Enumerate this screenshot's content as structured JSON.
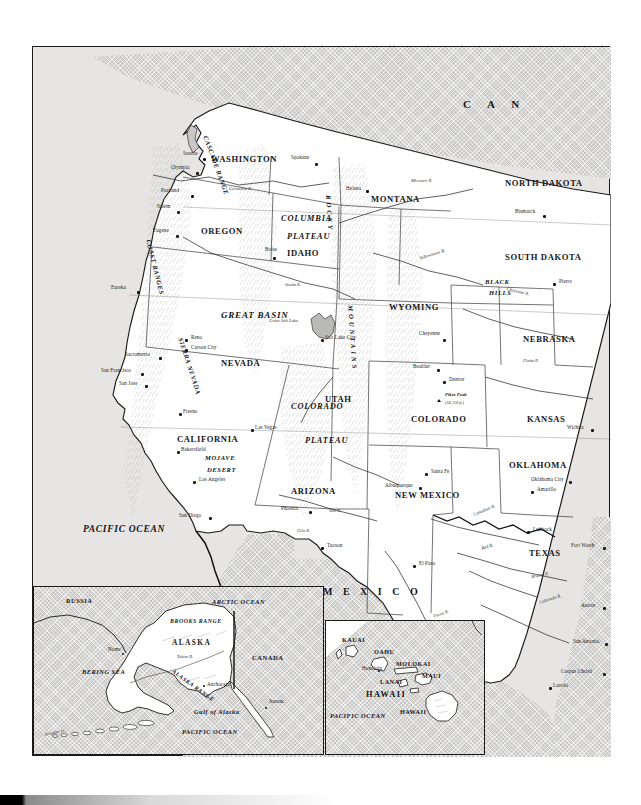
{
  "map": {
    "title": "Physical and political map of the Western United States",
    "countries": [
      {
        "name": "C  A  N",
        "full": "CANADA"
      },
      {
        "name": "M E X I C O",
        "full": "MEXICO"
      }
    ],
    "oceans": [
      {
        "label": "PACIFIC OCEAN"
      }
    ],
    "states": [
      {
        "label": "WASHINGTON"
      },
      {
        "label": "OREGON"
      },
      {
        "label": "IDAHO"
      },
      {
        "label": "MONTANA"
      },
      {
        "label": "NORTH DAKOTA"
      },
      {
        "label": "SOUTH DAKOTA"
      },
      {
        "label": "WYOMING"
      },
      {
        "label": "NEBRASKA"
      },
      {
        "label": "NEVADA"
      },
      {
        "label": "UTAH"
      },
      {
        "label": "COLORADO"
      },
      {
        "label": "KANSAS"
      },
      {
        "label": "CALIFORNIA"
      },
      {
        "label": "ARIZONA"
      },
      {
        "label": "NEW MEXICO"
      },
      {
        "label": "OKLAHOMA"
      },
      {
        "label": "TEXAS"
      }
    ],
    "physiographic": [
      {
        "label": "COLUMBIA"
      },
      {
        "label": "PLATEAU"
      },
      {
        "label": "GREAT BASIN"
      },
      {
        "label": "COLORADO"
      },
      {
        "label": "PLATEAU"
      },
      {
        "label": "MOJAVE"
      },
      {
        "label": "DESERT"
      },
      {
        "label": "BLACK"
      },
      {
        "label": "HILLS"
      },
      {
        "label": "CASCADE RANGE"
      },
      {
        "label": "COAST RANGES"
      },
      {
        "label": "SIERRA NEVADA"
      },
      {
        "label": "ROCKY"
      },
      {
        "label": "MOUNTAINS"
      }
    ],
    "cities": [
      {
        "label": "Seattle"
      },
      {
        "label": "Olympia"
      },
      {
        "label": "Spokane"
      },
      {
        "label": "Portland"
      },
      {
        "label": "Salem"
      },
      {
        "label": "Eugene"
      },
      {
        "label": "Boise"
      },
      {
        "label": "Helena"
      },
      {
        "label": "Bismarck"
      },
      {
        "label": "Pierre"
      },
      {
        "label": "Cheyenne"
      },
      {
        "label": "Eureka"
      },
      {
        "label": "Reno"
      },
      {
        "label": "Carson City"
      },
      {
        "label": "Sacramento"
      },
      {
        "label": "San Francisco"
      },
      {
        "label": "San Jose"
      },
      {
        "label": "Fresno"
      },
      {
        "label": "Bakersfield"
      },
      {
        "label": "Los Angeles"
      },
      {
        "label": "San Diego"
      },
      {
        "label": "Las Vegas"
      },
      {
        "label": "Salt Lake City"
      },
      {
        "label": "Boulder"
      },
      {
        "label": "Denver"
      },
      {
        "label": "Phoenix"
      },
      {
        "label": "Tucson"
      },
      {
        "label": "Santa Fe"
      },
      {
        "label": "Albuquerque"
      },
      {
        "label": "El Paso"
      },
      {
        "label": "Wichita"
      },
      {
        "label": "Oklahoma City"
      },
      {
        "label": "Amarillo"
      },
      {
        "label": "Lubbock"
      },
      {
        "label": "Fort Worth"
      },
      {
        "label": "Austin"
      },
      {
        "label": "San Antonio"
      },
      {
        "label": "Corpus Christi"
      },
      {
        "label": "Laredo"
      }
    ],
    "water_features": [
      {
        "label": "Columbia R."
      },
      {
        "label": "Snake R."
      },
      {
        "label": "Missouri R."
      },
      {
        "label": "Yellowstone R."
      },
      {
        "label": "Platte R."
      },
      {
        "label": "Great Salt Lake"
      },
      {
        "label": "Canadian R."
      },
      {
        "label": "Red R."
      },
      {
        "label": "Brazos R."
      },
      {
        "label": "Pecos R."
      },
      {
        "label": "Colorado R."
      },
      {
        "label": "Rio Grande"
      },
      {
        "label": "Gila R."
      },
      {
        "label": "Salt R."
      },
      {
        "label": "Cheyenne R."
      }
    ],
    "peaks": [
      {
        "label": "Pikes Peak",
        "elevation": "(14,110 ft.)"
      }
    ]
  },
  "alaska_inset": {
    "title": "ALASKA",
    "labels": [
      {
        "label": "RUSSIA"
      },
      {
        "label": "ARCTIC OCEAN"
      },
      {
        "label": "BROOKS RANGE"
      },
      {
        "label": "ALASKA"
      },
      {
        "label": "CANADA"
      },
      {
        "label": "BERING SEA"
      },
      {
        "label": "ALASKA RANGE"
      },
      {
        "label": "Yukon R."
      },
      {
        "label": "Gulf of Alaska"
      },
      {
        "label": "PACIFIC OCEAN"
      },
      {
        "label": "Aleutian Is."
      }
    ],
    "cities": [
      {
        "label": "Anchorage"
      },
      {
        "label": "Juneau"
      },
      {
        "label": "Nome"
      }
    ]
  },
  "hawaii_inset": {
    "title": "HAWAII",
    "islands": [
      {
        "label": "KAUAI"
      },
      {
        "label": "OAHU"
      },
      {
        "label": "MOLOKAI"
      },
      {
        "label": "MAUI"
      },
      {
        "label": "LANAI"
      },
      {
        "label": "HAWAII"
      }
    ],
    "cities": [
      {
        "label": "Honolulu"
      }
    ],
    "oceans": [
      {
        "label": "PACIFIC OCEAN"
      }
    ],
    "region_label": "HAWAII"
  },
  "colors": {
    "land": "#ffffff",
    "ocean": "#e6e5e3",
    "foreign_tint": "#c9c8c6",
    "border": "#1a1a1a",
    "text": "#16161a"
  }
}
